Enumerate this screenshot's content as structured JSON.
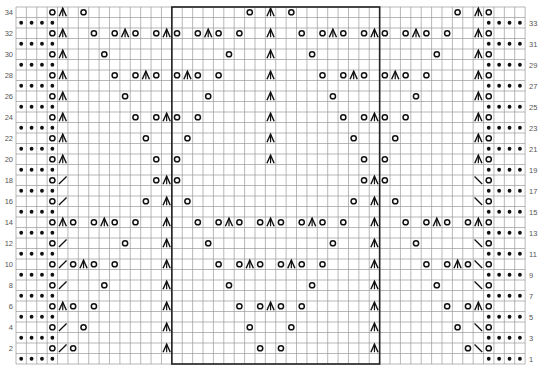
{
  "chart_data": {
    "type": "table",
    "title": "",
    "grid": {
      "columns": 49,
      "rows": 34,
      "left": 16,
      "top": 7,
      "cell_w": 10.39,
      "cell_h": 10.5
    },
    "repeat_box": {
      "col_start": 16,
      "col_end": 35,
      "row_start": 1,
      "row_end": 34
    },
    "legend_symbols": {
      "dot": "purl (bullet)",
      "o": "yarn over",
      "^": "centered double decrease",
      "/": "k2tog",
      "\\": "ssk"
    },
    "row_labels_left": [
      34,
      32,
      30,
      28,
      26,
      24,
      22,
      20,
      18,
      16,
      14,
      12,
      10,
      8,
      6,
      4,
      2
    ],
    "row_labels_right": [
      33,
      31,
      29,
      27,
      25,
      23,
      21,
      19,
      17,
      15,
      13,
      11,
      9,
      7,
      5,
      3,
      1
    ],
    "odd_row_dots": [
      1,
      2,
      3,
      4,
      46,
      47,
      48,
      49
    ],
    "rows": {
      "34": [
        [
          4,
          "o"
        ],
        [
          5,
          "^"
        ],
        [
          7,
          "o"
        ],
        [
          23,
          "o"
        ],
        [
          25,
          "^"
        ],
        [
          27,
          "o"
        ],
        [
          43,
          "o"
        ],
        [
          45,
          "^"
        ],
        [
          46,
          "o"
        ]
      ],
      "32": [
        [
          4,
          "o"
        ],
        [
          5,
          "^"
        ],
        [
          8,
          "o"
        ],
        [
          10,
          "o"
        ],
        [
          11,
          "^"
        ],
        [
          12,
          "o"
        ],
        [
          14,
          "o"
        ],
        [
          15,
          "^"
        ],
        [
          16,
          "o"
        ],
        [
          18,
          "o"
        ],
        [
          19,
          "^"
        ],
        [
          20,
          "o"
        ],
        [
          22,
          "o"
        ],
        [
          25,
          "^"
        ],
        [
          28,
          "o"
        ],
        [
          30,
          "o"
        ],
        [
          31,
          "^"
        ],
        [
          32,
          "o"
        ],
        [
          34,
          "o"
        ],
        [
          35,
          "^"
        ],
        [
          36,
          "o"
        ],
        [
          38,
          "o"
        ],
        [
          39,
          "^"
        ],
        [
          40,
          "o"
        ],
        [
          42,
          "o"
        ],
        [
          45,
          "^"
        ],
        [
          46,
          "o"
        ]
      ],
      "30": [
        [
          4,
          "o"
        ],
        [
          5,
          "^"
        ],
        [
          9,
          "o"
        ],
        [
          21,
          "o"
        ],
        [
          25,
          "^"
        ],
        [
          29,
          "o"
        ],
        [
          41,
          "o"
        ],
        [
          45,
          "^"
        ],
        [
          46,
          "o"
        ]
      ],
      "28": [
        [
          4,
          "o"
        ],
        [
          5,
          "^"
        ],
        [
          10,
          "o"
        ],
        [
          12,
          "o"
        ],
        [
          13,
          "^"
        ],
        [
          14,
          "o"
        ],
        [
          16,
          "o"
        ],
        [
          17,
          "^"
        ],
        [
          18,
          "o"
        ],
        [
          20,
          "o"
        ],
        [
          25,
          "^"
        ],
        [
          30,
          "o"
        ],
        [
          32,
          "o"
        ],
        [
          33,
          "^"
        ],
        [
          34,
          "o"
        ],
        [
          36,
          "o"
        ],
        [
          37,
          "^"
        ],
        [
          38,
          "o"
        ],
        [
          40,
          "o"
        ],
        [
          45,
          "^"
        ],
        [
          46,
          "o"
        ]
      ],
      "26": [
        [
          4,
          "o"
        ],
        [
          5,
          "^"
        ],
        [
          11,
          "o"
        ],
        [
          19,
          "o"
        ],
        [
          25,
          "^"
        ],
        [
          31,
          "o"
        ],
        [
          39,
          "o"
        ],
        [
          45,
          "^"
        ],
        [
          46,
          "o"
        ]
      ],
      "24": [
        [
          4,
          "o"
        ],
        [
          5,
          "^"
        ],
        [
          12,
          "o"
        ],
        [
          14,
          "o"
        ],
        [
          15,
          "^"
        ],
        [
          16,
          "o"
        ],
        [
          18,
          "o"
        ],
        [
          25,
          "^"
        ],
        [
          32,
          "o"
        ],
        [
          34,
          "o"
        ],
        [
          35,
          "^"
        ],
        [
          36,
          "o"
        ],
        [
          38,
          "o"
        ],
        [
          45,
          "^"
        ],
        [
          46,
          "o"
        ]
      ],
      "22": [
        [
          4,
          "o"
        ],
        [
          5,
          "^"
        ],
        [
          13,
          "o"
        ],
        [
          17,
          "o"
        ],
        [
          25,
          "^"
        ],
        [
          33,
          "o"
        ],
        [
          37,
          "o"
        ],
        [
          45,
          "^"
        ],
        [
          46,
          "o"
        ]
      ],
      "20": [
        [
          4,
          "o"
        ],
        [
          5,
          "^"
        ],
        [
          14,
          "o"
        ],
        [
          16,
          "o"
        ],
        [
          25,
          "^"
        ],
        [
          34,
          "o"
        ],
        [
          36,
          "o"
        ],
        [
          45,
          "^"
        ],
        [
          46,
          "o"
        ]
      ],
      "18": [
        [
          4,
          "o"
        ],
        [
          5,
          "/"
        ],
        [
          14,
          "o"
        ],
        [
          15,
          "^"
        ],
        [
          16,
          "o"
        ],
        [
          34,
          "o"
        ],
        [
          35,
          "^"
        ],
        [
          36,
          "o"
        ],
        [
          45,
          "\\"
        ],
        [
          46,
          "o"
        ]
      ],
      "16": [
        [
          4,
          "o"
        ],
        [
          5,
          "/"
        ],
        [
          13,
          "o"
        ],
        [
          15,
          "^"
        ],
        [
          17,
          "o"
        ],
        [
          33,
          "o"
        ],
        [
          35,
          "^"
        ],
        [
          37,
          "o"
        ],
        [
          45,
          "\\"
        ],
        [
          46,
          "o"
        ]
      ],
      "14": [
        [
          4,
          "o"
        ],
        [
          5,
          "^"
        ],
        [
          6,
          "o"
        ],
        [
          8,
          "o"
        ],
        [
          9,
          "^"
        ],
        [
          10,
          "o"
        ],
        [
          12,
          "o"
        ],
        [
          15,
          "^"
        ],
        [
          18,
          "o"
        ],
        [
          20,
          "o"
        ],
        [
          21,
          "^"
        ],
        [
          22,
          "o"
        ],
        [
          24,
          "o"
        ],
        [
          25,
          "^"
        ],
        [
          26,
          "o"
        ],
        [
          28,
          "o"
        ],
        [
          29,
          "^"
        ],
        [
          30,
          "o"
        ],
        [
          32,
          "o"
        ],
        [
          35,
          "^"
        ],
        [
          38,
          "o"
        ],
        [
          40,
          "o"
        ],
        [
          41,
          "^"
        ],
        [
          42,
          "o"
        ],
        [
          44,
          "o"
        ],
        [
          45,
          "^"
        ],
        [
          46,
          "o"
        ]
      ],
      "12": [
        [
          4,
          "o"
        ],
        [
          5,
          "/"
        ],
        [
          11,
          "o"
        ],
        [
          15,
          "^"
        ],
        [
          19,
          "o"
        ],
        [
          31,
          "o"
        ],
        [
          35,
          "^"
        ],
        [
          39,
          "o"
        ],
        [
          45,
          "\\"
        ],
        [
          46,
          "o"
        ]
      ],
      "10": [
        [
          4,
          "o"
        ],
        [
          5,
          "/"
        ],
        [
          6,
          "o"
        ],
        [
          7,
          "^"
        ],
        [
          8,
          "o"
        ],
        [
          10,
          "o"
        ],
        [
          15,
          "^"
        ],
        [
          20,
          "o"
        ],
        [
          22,
          "o"
        ],
        [
          23,
          "^"
        ],
        [
          24,
          "o"
        ],
        [
          26,
          "o"
        ],
        [
          27,
          "^"
        ],
        [
          28,
          "o"
        ],
        [
          30,
          "o"
        ],
        [
          35,
          "^"
        ],
        [
          40,
          "o"
        ],
        [
          42,
          "o"
        ],
        [
          43,
          "^"
        ],
        [
          44,
          "o"
        ],
        [
          45,
          "\\"
        ],
        [
          46,
          "o"
        ]
      ],
      "8": [
        [
          4,
          "o"
        ],
        [
          5,
          "/"
        ],
        [
          9,
          "o"
        ],
        [
          15,
          "^"
        ],
        [
          21,
          "o"
        ],
        [
          29,
          "o"
        ],
        [
          35,
          "^"
        ],
        [
          41,
          "o"
        ],
        [
          45,
          "\\"
        ],
        [
          46,
          "o"
        ]
      ],
      "6": [
        [
          4,
          "o"
        ],
        [
          5,
          "^"
        ],
        [
          6,
          "o"
        ],
        [
          8,
          "o"
        ],
        [
          15,
          "^"
        ],
        [
          22,
          "o"
        ],
        [
          24,
          "o"
        ],
        [
          25,
          "^"
        ],
        [
          26,
          "o"
        ],
        [
          28,
          "o"
        ],
        [
          35,
          "^"
        ],
        [
          42,
          "o"
        ],
        [
          44,
          "o"
        ],
        [
          45,
          "^"
        ],
        [
          46,
          "o"
        ]
      ],
      "4": [
        [
          4,
          "o"
        ],
        [
          5,
          "/"
        ],
        [
          7,
          "o"
        ],
        [
          15,
          "^"
        ],
        [
          23,
          "o"
        ],
        [
          27,
          "o"
        ],
        [
          35,
          "^"
        ],
        [
          43,
          "o"
        ],
        [
          45,
          "\\"
        ],
        [
          46,
          "o"
        ]
      ],
      "2": [
        [
          4,
          "o"
        ],
        [
          5,
          "/"
        ],
        [
          6,
          "o"
        ],
        [
          15,
          "^"
        ],
        [
          24,
          "o"
        ],
        [
          26,
          "o"
        ],
        [
          35,
          "^"
        ],
        [
          44,
          "o"
        ],
        [
          45,
          "\\"
        ],
        [
          46,
          "o"
        ]
      ]
    },
    "colors": {
      "grid_line": "#9a9a9a",
      "symbol": "#111111",
      "label": "#555555",
      "box": "#222222"
    }
  }
}
